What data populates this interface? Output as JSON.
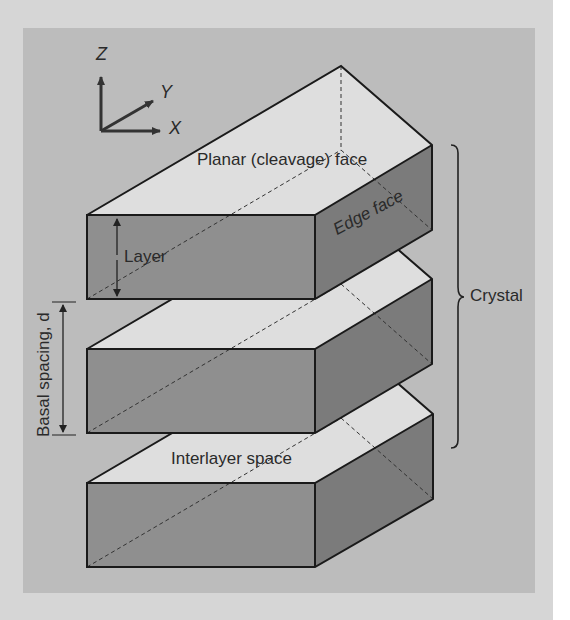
{
  "figure": {
    "axes": {
      "z": "Z",
      "y": "Y",
      "x": "X"
    },
    "labels": {
      "planar_face": "Planar (cleavage) face",
      "edge_face": "Edge face",
      "layer": "Layer",
      "basal_spacing": "Basal spacing, d",
      "crystal": "Crystal",
      "interlayer": "Interlayer space"
    },
    "colors": {
      "panel": "#bcbcbc",
      "border": "#d6d6d6",
      "top_face": "#dedede",
      "front_face": "#8f8f8f",
      "edge_face": "#7b7b7b",
      "line": "#1a1a1a"
    },
    "slabs": [
      {
        "name": "top",
        "front_top_y": 215,
        "front_bottom_y": 299
      },
      {
        "name": "middle",
        "front_top_y": 349,
        "front_bottom_y": 433
      },
      {
        "name": "bottom",
        "front_top_y": 483,
        "front_bottom_y": 567
      }
    ]
  }
}
